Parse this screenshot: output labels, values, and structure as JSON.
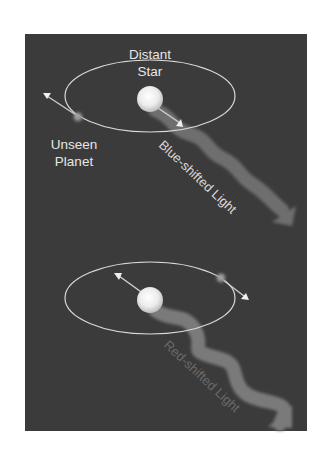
{
  "figure": {
    "panel_background": "#3b3b3b",
    "orbit_color": "#d8d8d8",
    "star_color": "#f2f2f2",
    "planet_color": "#9a9a9a",
    "arrow_color": "#d0d0d0"
  },
  "top_scene": {
    "star_label_line1": "Distant",
    "star_label_line2": "Star",
    "planet_label_line1": "Unseen",
    "planet_label_line2": "Planet",
    "wave_label": "Blue-shifted Light",
    "wave_color": "#6e6e6e",
    "wave_label_color": "#d9d9d9"
  },
  "bottom_scene": {
    "wave_label": "Red-shifted Light",
    "wave_color": "#7a7a7a",
    "wave_label_color": "#6a6a6a"
  }
}
